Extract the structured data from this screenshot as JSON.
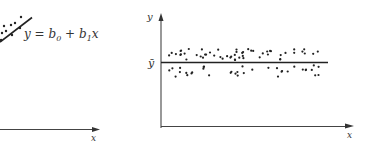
{
  "chart_data": [
    {
      "type": "scatter",
      "panel": "left",
      "title": "",
      "xlabel": "x",
      "ylabel": "",
      "annotation": "y = b0 + b1x",
      "fit_line": {
        "label": "y = b0 + b1x",
        "kind": "regression line (positive slope)"
      },
      "grid": false,
      "points": [
        [
          2,
          33
        ],
        [
          6,
          31
        ],
        [
          4,
          26
        ],
        [
          11,
          25
        ],
        [
          15,
          23
        ],
        [
          20,
          28
        ],
        [
          21,
          17
        ],
        [
          1,
          40
        ],
        [
          12,
          35
        ]
      ]
    },
    {
      "type": "scatter",
      "panel": "right",
      "title": "",
      "xlabel": "x",
      "ylabel": "y",
      "annotation": "ȳ",
      "fit_line": {
        "label": "ȳ",
        "kind": "horizontal mean line"
      },
      "grid": false,
      "n_points_approx": 90,
      "note": "points scattered evenly about horizontal line at ȳ with no trend"
    }
  ],
  "labels": {
    "left_x": "x",
    "left_eq_y": "y = b",
    "left_eq_sub0": "0",
    "left_eq_plus": " + b",
    "left_eq_sub1": "1",
    "left_eq_x": "x",
    "right_y": "y",
    "right_ybar": "ȳ",
    "right_x": "x"
  }
}
